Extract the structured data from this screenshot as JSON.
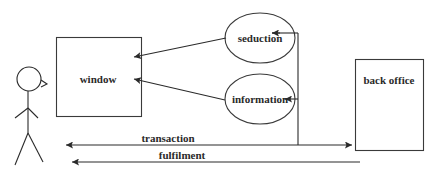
{
  "diagram": {
    "actor": {
      "label": ""
    },
    "nodes": {
      "window": {
        "label": "window",
        "shape": "rectangle"
      },
      "seduction": {
        "label": "seduction",
        "shape": "ellipse"
      },
      "information": {
        "label": "information",
        "shape": "ellipse"
      },
      "back_office": {
        "label": "back office",
        "shape": "rectangle"
      }
    },
    "edges": [
      {
        "from": "seduction",
        "to": "window",
        "label": ""
      },
      {
        "from": "information",
        "to": "window",
        "label": ""
      },
      {
        "from": "transaction-line",
        "to": "seduction",
        "label": ""
      },
      {
        "from": "transaction-line",
        "to": "information",
        "label": ""
      },
      {
        "from": "actor",
        "to": "back_office",
        "label": "transaction",
        "bidirectional": true
      },
      {
        "from": "back_office",
        "to": "actor",
        "label": "fulfilment"
      }
    ],
    "labels": {
      "transaction": "transaction",
      "fulfilment": "fulfilment"
    },
    "colors": {
      "line": "#2a2a2a",
      "background": "#ffffff"
    }
  }
}
